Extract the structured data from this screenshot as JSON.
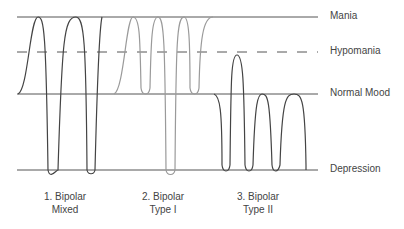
{
  "diagram": {
    "levels": [
      {
        "name": "Mania",
        "y": 17,
        "style": "solid"
      },
      {
        "name": "Hypomania",
        "y": 52,
        "style": "dashed"
      },
      {
        "name": "Normal Mood",
        "y": 94,
        "style": "solid"
      },
      {
        "name": "Depression",
        "y": 170,
        "style": "solid"
      }
    ],
    "captions": [
      {
        "line1": "1. Bipolar",
        "line2": "Mixed"
      },
      {
        "line1": "2. Bipolar",
        "line2": "Type I"
      },
      {
        "line1": "3. Bipolar",
        "line2": "Type II"
      }
    ],
    "colors": {
      "dark": "#444444",
      "gray": "#9a9a9a",
      "line": "#555555"
    }
  }
}
